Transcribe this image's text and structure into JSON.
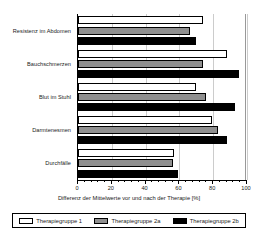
{
  "chart_data": {
    "type": "bar",
    "orientation": "horizontal",
    "title": "",
    "xlabel": "Differenz der Mittelwerte vor und nach der Therapie [%]",
    "ylabel": "",
    "xlim": [
      0,
      100
    ],
    "xticks": [
      0,
      20,
      40,
      60,
      80,
      100
    ],
    "xticklabels": [
      "0",
      "20",
      "40",
      "60",
      "80",
      "100"
    ],
    "grid": true,
    "grid_axis": "x",
    "legend_position": "bottom",
    "categories": [
      "Resistenz im Abdomen",
      "Bauchschmerzen",
      "Blut im Stuhl",
      "Darmtenesmen",
      "Durchfälle"
    ],
    "series": [
      {
        "name": "Therapiegruppe 1",
        "color": "#ffffff",
        "values": [
          74,
          88,
          70,
          79,
          57
        ]
      },
      {
        "name": "Therapiegruppe 2a",
        "color": "#8f8f8f",
        "values": [
          66,
          74,
          76,
          83,
          56
        ]
      },
      {
        "name": "Therapiegruppe 2b",
        "color": "#000000",
        "values": [
          70,
          95,
          93,
          88,
          59
        ]
      }
    ]
  },
  "legend": {
    "entries": [
      {
        "label": "Therapiegruppe 1",
        "swatch": "white-swatch"
      },
      {
        "label": "Therapiegruppe 2a",
        "swatch": "gray-swatch"
      },
      {
        "label": "Therapiegruppe 2b",
        "swatch": "black-swatch"
      }
    ]
  }
}
